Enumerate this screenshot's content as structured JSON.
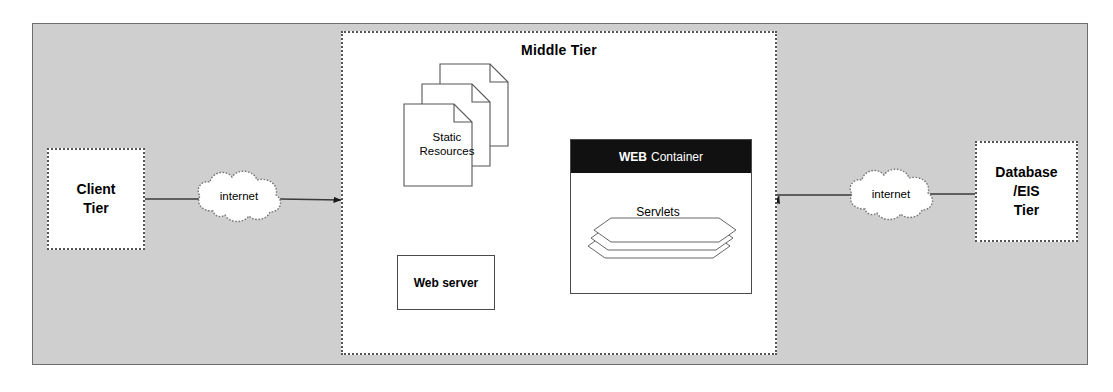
{
  "diagram": {
    "background_color": "#cfcfcf",
    "panel_border_color": "#6e6e6e"
  },
  "middle_tier": {
    "label": "Middle Tier",
    "border_style": "dotted"
  },
  "client_tier": {
    "line1": "Client",
    "line2": "Tier"
  },
  "database_tier": {
    "line1": "Database",
    "line2": "/EIS",
    "line3": "Tier"
  },
  "clouds": [
    {
      "label": "internet",
      "position": "left"
    },
    {
      "label": "internet",
      "position": "right"
    }
  ],
  "static_resources": {
    "line1": "Static",
    "line2": "Resources",
    "sheet_count": 3
  },
  "web_server": {
    "label": "Web server"
  },
  "web_container": {
    "header_keyword": "WEB",
    "header_rest": "Container",
    "header_background": "#111111",
    "header_text_color": "#ffffff",
    "servlets": {
      "label": "Servlets",
      "stack_count": 3
    }
  },
  "connections": [
    {
      "from": "client-tier",
      "to": "cloud-left",
      "arrow": false
    },
    {
      "from": "cloud-left",
      "to": "middle-tier",
      "arrow": true
    },
    {
      "from": "middle-tier-edge",
      "to": "web-server",
      "arrow": false
    },
    {
      "from": "static-resources",
      "to": "web-server",
      "arrow": true
    },
    {
      "from": "web-container",
      "to": "web-server",
      "arrow": true
    },
    {
      "from": "web-container",
      "to": "middle-tier-right-edge",
      "arrow": true
    },
    {
      "from": "middle-tier-right-edge",
      "to": "cloud-right",
      "arrow": false
    },
    {
      "from": "cloud-right",
      "to": "database-tier",
      "arrow": false
    }
  ]
}
